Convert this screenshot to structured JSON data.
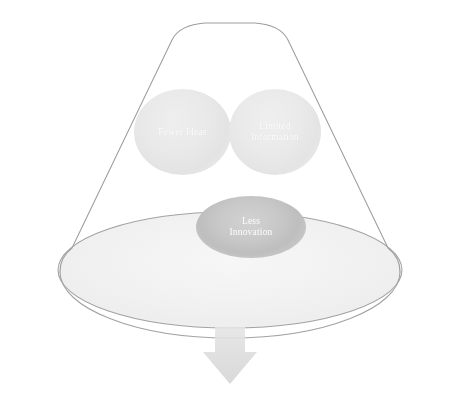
{
  "diagram": {
    "type": "funnel",
    "shapes": {
      "funnel": {
        "name": "funnel-cone",
        "outline_color": "#9a9a9a",
        "fill_color": "#ffffff"
      },
      "bowl": {
        "name": "funnel-bowl-ellipse",
        "outline_color": "#a0a0a0",
        "fill_color": "#f3f3f3"
      },
      "arrow": {
        "name": "output-arrow",
        "color": "#d8d8d8",
        "direction": "down"
      }
    },
    "bubbles": [
      {
        "id": "fewer-ideas",
        "label": "Fewer Ideas",
        "lines": [
          "Fewer Ideas"
        ],
        "color": "#e6e6e6",
        "text_color": "#ffffff",
        "shape": "circle"
      },
      {
        "id": "limited-information",
        "label": "Limited Information",
        "lines": [
          "Limited",
          "Information"
        ],
        "color": "#e7e7e7",
        "text_color": "#ffffff",
        "shape": "circle"
      },
      {
        "id": "less-innovation",
        "label": "Less Innovation",
        "lines": [
          "Less",
          "Innovation"
        ],
        "color": "#c2c2c2",
        "text_color": "#ffffff",
        "shape": "ellipse"
      }
    ]
  }
}
